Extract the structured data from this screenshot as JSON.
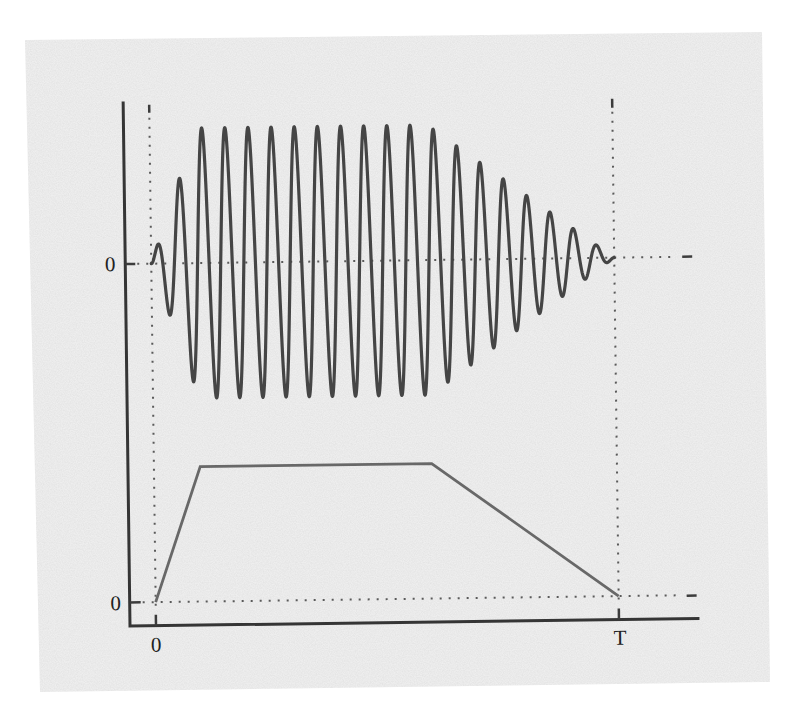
{
  "colors": {
    "page_background": "#ffffff",
    "panel_background": "#eeeeee",
    "wave": "#454545",
    "envelope": "#686868",
    "axes": "#353535"
  },
  "chart_data": {
    "type": "line",
    "title": "",
    "xlabel": "",
    "ylabel": "",
    "x_tick_labels": [
      "0",
      "T"
    ],
    "x_range": [
      "0",
      "T"
    ],
    "y_tick_labels": {
      "upper_panel": [
        "0"
      ],
      "lower_panel": [
        "0"
      ]
    },
    "grid": false,
    "legend": "none",
    "reference_lines": "dotted lines at x=0, x=T and at y=0 for both traces",
    "series": [
      {
        "name": "modulated signal",
        "panel": "upper",
        "kind": "sinusoid multiplied by trapezoidal envelope",
        "cycles_over_T": 20,
        "peak_amplitude": 1.0,
        "starts_at": 0,
        "ends_at": "T"
      },
      {
        "name": "envelope",
        "panel": "lower",
        "kind": "trapezoid",
        "x": [
          0,
          0.1,
          0.6,
          1.0
        ],
        "x_units": "fraction of T",
        "y": [
          0,
          1,
          1,
          0
        ]
      }
    ]
  }
}
